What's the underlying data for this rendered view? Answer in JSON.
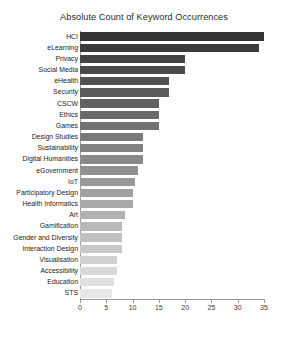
{
  "chart_data": {
    "type": "bar",
    "orientation": "horizontal",
    "title": "Absolute Count of Keyword Occurrences",
    "xlabel": "",
    "ylabel": "",
    "xlim": [
      0,
      35
    ],
    "xticks": [
      0,
      5,
      10,
      15,
      20,
      25,
      30,
      35
    ],
    "grid": false,
    "legend": false,
    "colormap": "greys_descending",
    "bar_color_start": "#333333",
    "bar_color_end": "#e8e8e8",
    "categories": [
      "HCI",
      "eLearning",
      "Privacy",
      "Social Media",
      "eHealth",
      "Security",
      "CSCW",
      "Ethics",
      "Games",
      "Design Studies",
      "Sustainability",
      "Digital Humanities",
      "eGovernment",
      "IoT",
      "Participatory Design",
      "Health Informatics",
      "Art",
      "Gamification",
      "Gender and Diversity",
      "Interaction Design",
      "Visualisation",
      "Accessibility",
      "Education",
      "STS"
    ],
    "values": [
      35,
      34,
      20,
      20,
      17,
      17,
      15,
      15,
      15,
      12,
      12,
      12,
      11,
      10.5,
      10,
      10,
      8.5,
      8,
      8,
      8,
      7,
      7,
      6.5,
      6
    ]
  }
}
